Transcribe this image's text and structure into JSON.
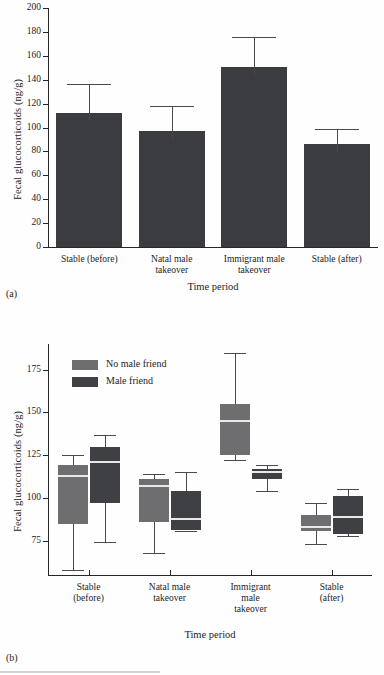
{
  "figure": {
    "panel_a_tag": "(a)",
    "panel_b_tag": "(b)"
  },
  "chart_data": [
    {
      "id": "panel-a",
      "type": "bar",
      "title": "",
      "xlabel": "Time period",
      "ylabel": "Fecal glucocorticoids (ng/g)",
      "ylim": [
        0,
        200
      ],
      "yticks": [
        0,
        20,
        40,
        60,
        80,
        100,
        120,
        140,
        160,
        180,
        200
      ],
      "ytick_labels": [
        "0",
        "20",
        "40",
        "60",
        "80",
        "100",
        "120",
        "140",
        "160",
        "180",
        "200"
      ],
      "grid": false,
      "legend": "none",
      "categories": [
        "Stable (before)",
        "Natal male\ntakeover",
        "Immigrant male\ntakeover",
        "Stable (after)"
      ],
      "values": [
        112,
        97,
        151,
        86
      ],
      "error_upper": [
        136,
        118,
        176,
        99
      ],
      "bar_color": "#3b3c40"
    },
    {
      "id": "panel-b",
      "type": "boxplot",
      "title": "",
      "xlabel": "Time period",
      "ylabel": "Fecal glucocorticoids (ng/g)",
      "ylim": [
        55,
        190
      ],
      "yticks": [
        75,
        100,
        125,
        150,
        175
      ],
      "ytick_labels": [
        "75",
        "100",
        "125",
        "150",
        "175"
      ],
      "grid": false,
      "legend_position": "upper-left",
      "categories": [
        "Stable\n(before)",
        "Natal male\ntakeover",
        "Immigrant\nmale\ntakeover",
        "Stable\n(after)"
      ],
      "series": [
        {
          "name": "No male friend",
          "color": "#6e6e70",
          "boxes": [
            {
              "whisker_low": 58,
              "q1": 85,
              "median": 113,
              "q3": 119,
              "whisker_high": 125
            },
            {
              "whisker_low": 68,
              "q1": 86,
              "median": 107,
              "q3": 111,
              "whisker_high": 114
            },
            {
              "whisker_low": 122,
              "q1": 125,
              "median": 145,
              "q3": 155,
              "whisker_high": 185
            },
            {
              "whisker_low": 73,
              "q1": 81,
              "median": 83,
              "q3": 90,
              "whisker_high": 97
            }
          ]
        },
        {
          "name": "Male friend",
          "color": "#3f4044",
          "boxes": [
            {
              "whisker_low": 74,
              "q1": 97,
              "median": 121,
              "q3": 130,
              "whisker_high": 137
            },
            {
              "whisker_low": 81,
              "q1": 81,
              "median": 88,
              "q3": 104,
              "whisker_high": 115
            },
            {
              "whisker_low": 104,
              "q1": 111,
              "median": 115,
              "q3": 117,
              "whisker_high": 119
            },
            {
              "whisker_low": 78,
              "q1": 79,
              "median": 89,
              "q3": 101,
              "whisker_high": 105
            }
          ]
        }
      ]
    }
  ]
}
